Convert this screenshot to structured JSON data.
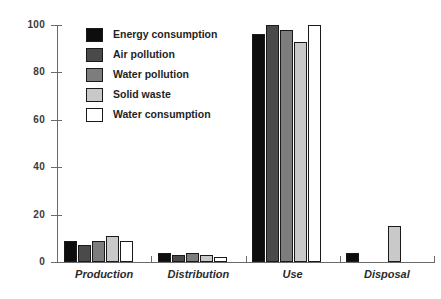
{
  "chart_data": {
    "type": "bar",
    "title": "",
    "subtitle": "",
    "xlabel": "",
    "ylabel": "",
    "ylim": [
      0,
      100
    ],
    "yticks": [
      0,
      20,
      40,
      60,
      80,
      100
    ],
    "ytick_labels": [
      "0",
      "20",
      "40",
      "60",
      "80",
      "100"
    ],
    "grid": false,
    "legend_position": "top-left-inside",
    "categories": [
      "Production",
      "Distribution",
      "Use",
      "Disposal"
    ],
    "series": [
      {
        "name": "Energy consumption",
        "color": "#0d0d0d",
        "values": [
          9,
          4,
          96,
          4
        ]
      },
      {
        "name": "Air pollution",
        "color": "#4a4a4a",
        "values": [
          7,
          3,
          100,
          0
        ]
      },
      {
        "name": "Water pollution",
        "color": "#7d7d7d",
        "values": [
          9,
          4,
          98,
          0
        ]
      },
      {
        "name": "Solid waste",
        "color": "#c9c9c9",
        "values": [
          11,
          3,
          93,
          15
        ]
      },
      {
        "name": "Water consumption",
        "color": "#ffffff",
        "values": [
          9,
          2,
          100,
          0
        ]
      }
    ]
  },
  "legend": {
    "items": [
      {
        "label": "Energy consumption",
        "color": "#0d0d0d"
      },
      {
        "label": "Air pollution",
        "color": "#4a4a4a"
      },
      {
        "label": "Water pollution",
        "color": "#7d7d7d"
      },
      {
        "label": "Solid waste",
        "color": "#c9c9c9"
      },
      {
        "label": "Water consumption",
        "color": "#ffffff"
      }
    ]
  },
  "colors": {
    "axis": "#6a6a6a",
    "bar_outline": "#1a1a1a",
    "tick_text": "#3a3a3a",
    "label_text": "#2b2b2b",
    "background": "#ffffff"
  }
}
